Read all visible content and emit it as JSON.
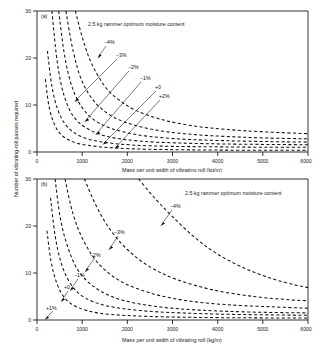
{
  "figure": {
    "y_axis_label": "Number of vibrating-roll passes required",
    "x_axis_label": "Mass per unit width of vibrating roll (kg/m)",
    "note": "2.5 kg rammer optimum moisture content",
    "panel_a_tag": "(a)",
    "panel_b_tag": "(b)",
    "x_ticks": [
      "0",
      "1000",
      "2000",
      "3000",
      "4000",
      "5000",
      "6000"
    ],
    "y_ticks": [
      "0",
      "10",
      "20",
      "30"
    ]
  },
  "chart_data": [
    {
      "type": "line",
      "panel": "(a)",
      "title": "",
      "subtitle": "2.5 kg rammer optimum moisture content",
      "xlabel": "Mass per unit width of vibrating roll (kg/m)",
      "ylabel": "Number of vibrating-roll passes required",
      "xlim": [
        0,
        6000
      ],
      "ylim": [
        0,
        30
      ],
      "xticks": [
        0,
        1000,
        2000,
        3000,
        4000,
        5000,
        6000
      ],
      "yticks": [
        0,
        10,
        20,
        30
      ],
      "grid": false,
      "legend": "inline curve labels",
      "linestyle": "dashed",
      "series": [
        {
          "name": "-4%",
          "label": "−4%",
          "x": [
            850,
            1000,
            1200,
            1500,
            1800,
            2200,
            2800,
            3500,
            4200,
            5000,
            6000
          ],
          "values": [
            30,
            24.5,
            19.0,
            14.0,
            11.2,
            8.8,
            6.8,
            5.5,
            4.8,
            4.3,
            3.9
          ]
        },
        {
          "name": "-3%",
          "label": "−3%",
          "x": [
            640,
            800,
            1000,
            1300,
            1700,
            2200,
            2800,
            3500,
            4200,
            5000,
            6000
          ],
          "values": [
            30,
            21.5,
            15.0,
            10.4,
            7.4,
            5.6,
            4.4,
            3.7,
            3.3,
            3.0,
            2.8
          ]
        },
        {
          "name": "-2%",
          "label": "−2%",
          "x": [
            480,
            620,
            800,
            1050,
            1400,
            1900,
            2500,
            3300,
            4200,
            5200,
            6000
          ],
          "values": [
            30,
            20.0,
            13.2,
            8.8,
            6.0,
            4.3,
            3.3,
            2.7,
            2.4,
            2.2,
            2.1
          ]
        },
        {
          "name": "-1%",
          "label": "−1%",
          "x": [
            330,
            450,
            600,
            820,
            1150,
            1600,
            2300,
            3200,
            4200,
            5200,
            6000
          ],
          "values": [
            30,
            19.0,
            12.0,
            7.4,
            4.8,
            3.2,
            2.3,
            1.9,
            1.7,
            1.6,
            1.55
          ]
        },
        {
          "name": "+0",
          "label": "+0",
          "x": [
            230,
            330,
            460,
            650,
            950,
            1400,
            2100,
            3000,
            4000,
            5100,
            6000
          ],
          "values": [
            21.5,
            14.0,
            9.0,
            5.6,
            3.4,
            2.2,
            1.5,
            1.2,
            1.1,
            1.0,
            1.0
          ]
        },
        {
          "name": "+2%",
          "label": "+2%",
          "x": [
            185,
            270,
            400,
            580,
            880,
            1300,
            1750,
            2400,
            3400,
            4600,
            6000
          ],
          "values": [
            15.5,
            9.5,
            5.6,
            3.3,
            1.9,
            1.2,
            0.85,
            0.6,
            0.45,
            0.38,
            0.35
          ]
        }
      ],
      "annotations": [
        {
          "text": "−4%",
          "x_px": 107,
          "y_px": 43
        },
        {
          "text": "−3%",
          "x_px": 118,
          "y_px": 56
        },
        {
          "text": "−2%",
          "x_px": 130,
          "y_px": 68
        },
        {
          "text": "−1%",
          "x_px": 142,
          "y_px": 79
        },
        {
          "text": "+0",
          "x_px": 156,
          "y_px": 88
        },
        {
          "text": "+2%",
          "x_px": 160,
          "y_px": 97
        }
      ]
    },
    {
      "type": "line",
      "panel": "(b)",
      "title": "",
      "subtitle": "2.5 kg rammer optimum moisture content",
      "xlabel": "Mass per unit width of vibrating roll (kg/m)",
      "ylabel": "Number of vibrating-roll passes required",
      "xlim": [
        0,
        6000
      ],
      "ylim": [
        0,
        30
      ],
      "xticks": [
        0,
        1000,
        2000,
        3000,
        4000,
        5000,
        6000
      ],
      "yticks": [
        0,
        10,
        20,
        30
      ],
      "grid": false,
      "legend": "inline curve labels",
      "linestyle": "dashed",
      "series": [
        {
          "name": "-4%",
          "label": "−4%",
          "x": [
            2250,
            2600,
            3000,
            3500,
            4000,
            4600,
            5200,
            5700,
            6000
          ],
          "values": [
            30,
            26.0,
            22.0,
            17.5,
            14.0,
            11.0,
            8.8,
            7.5,
            6.9
          ]
        },
        {
          "name": "-3%",
          "label": "−3%",
          "x": [
            1050,
            1300,
            1600,
            2000,
            2500,
            3100,
            3900,
            4800,
            5600,
            6000
          ],
          "values": [
            30,
            24.5,
            19.5,
            15.0,
            11.3,
            8.6,
            6.4,
            5.0,
            4.3,
            4.1
          ]
        },
        {
          "name": "-2%",
          "label": "−2%",
          "x": [
            620,
            800,
            1050,
            1400,
            1900,
            2600,
            3400,
            4300,
            5200,
            6000
          ],
          "values": [
            30,
            22.5,
            16.5,
            11.6,
            8.0,
            5.5,
            4.0,
            3.2,
            2.8,
            2.5
          ]
        },
        {
          "name": "-1%",
          "label": "−1%",
          "x": [
            400,
            520,
            700,
            950,
            1350,
            1900,
            2700,
            3600,
            4700,
            6000
          ],
          "values": [
            30,
            21.5,
            15.0,
            10.0,
            6.5,
            4.2,
            2.8,
            2.1,
            1.7,
            1.5
          ]
        },
        {
          "name": "+0",
          "label": "+0",
          "x": [
            300,
            400,
            540,
            750,
            1050,
            1550,
            2300,
            3200,
            4300,
            6000
          ],
          "values": [
            26.0,
            18.0,
            12.0,
            7.6,
            4.8,
            3.0,
            2.0,
            1.5,
            1.2,
            1.0
          ]
        },
        {
          "name": "+1%",
          "label": "+1%",
          "x": [
            220,
            310,
            440,
            620,
            900,
            1350,
            2000,
            2900,
            4100,
            6000
          ],
          "values": [
            19.0,
            12.5,
            7.8,
            4.6,
            2.7,
            1.5,
            0.95,
            0.65,
            0.5,
            0.4
          ]
        }
      ],
      "annotations": [
        {
          "text": "−4%",
          "x_px": 168,
          "y_px": 206
        },
        {
          "text": "−3%",
          "x_px": 112,
          "y_px": 233
        },
        {
          "text": "−2%",
          "x_px": 88,
          "y_px": 256
        },
        {
          "text": "−1%",
          "x_px": 72,
          "y_px": 276
        },
        {
          "text": "+0",
          "x_px": 62,
          "y_px": 288
        },
        {
          "text": "+1%",
          "x_px": 45,
          "y_px": 311
        }
      ]
    }
  ]
}
